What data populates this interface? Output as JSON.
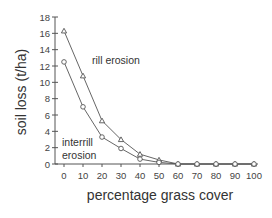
{
  "chart_data": {
    "type": "line",
    "title": "",
    "xlabel": "percentage grass cover",
    "ylabel": "soil loss (t/ha)",
    "x": [
      0,
      10,
      20,
      30,
      40,
      50,
      60,
      70,
      80,
      90,
      100
    ],
    "xlim": [
      0,
      100
    ],
    "ylim": [
      0,
      18
    ],
    "xticks": [
      0,
      10,
      20,
      30,
      40,
      50,
      60,
      70,
      80,
      90,
      100
    ],
    "yticks": [
      0,
      2,
      4,
      6,
      8,
      10,
      12,
      14,
      16,
      18
    ],
    "grid": false,
    "legend": "none (inline annotations)",
    "series": [
      {
        "name": "rill erosion",
        "marker": "triangle",
        "values": [
          16.3,
          10.8,
          5.3,
          3.0,
          1.2,
          0.5,
          0,
          0,
          0,
          0,
          0
        ]
      },
      {
        "name": "interrill erosion",
        "marker": "circle",
        "values": [
          12.5,
          7.0,
          3.3,
          1.9,
          0.6,
          0.2,
          0,
          0,
          0,
          0,
          0
        ]
      }
    ],
    "annotations": [
      {
        "text": "rill erosion",
        "near_series": "rill erosion"
      },
      {
        "text": "interrill",
        "line2": "erosion",
        "near_series": "interrill erosion"
      }
    ]
  },
  "labels": {
    "xlabel": "percentage grass cover",
    "ylabel": "soil loss (t/ha)",
    "rill_annotation": "rill erosion",
    "interrill_annotation_line1": "interrill",
    "interrill_annotation_line2": "erosion"
  }
}
